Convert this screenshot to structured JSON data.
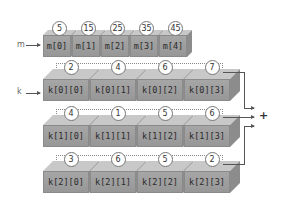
{
  "arrays": {
    "m": {
      "label": "m",
      "cells": [
        {
          "name": "m[0]",
          "value": "5"
        },
        {
          "name": "m[1]",
          "value": "15"
        },
        {
          "name": "m[2]",
          "value": "25"
        },
        {
          "name": "m[3]",
          "value": "35"
        },
        {
          "name": "m[4]",
          "value": "45"
        }
      ]
    },
    "k": {
      "label": "k",
      "rows": [
        {
          "cells": [
            {
              "name": "k[0][0]",
              "value": "2"
            },
            {
              "name": "k[0][1]",
              "value": "4"
            },
            {
              "name": "k[0][2]",
              "value": "6"
            },
            {
              "name": "k[0][3]",
              "value": "7"
            }
          ]
        },
        {
          "cells": [
            {
              "name": "k[1][0]",
              "value": "4"
            },
            {
              "name": "k[1][1]",
              "value": "1"
            },
            {
              "name": "k[1][2]",
              "value": "5"
            },
            {
              "name": "k[1][3]",
              "value": "6"
            }
          ]
        },
        {
          "cells": [
            {
              "name": "k[2][0]",
              "value": "3"
            },
            {
              "name": "k[2][1]",
              "value": "6"
            },
            {
              "name": "k[2][2]",
              "value": "5"
            },
            {
              "name": "k[2][3]",
              "value": "2"
            }
          ]
        }
      ]
    }
  },
  "sum_symbol": "+"
}
